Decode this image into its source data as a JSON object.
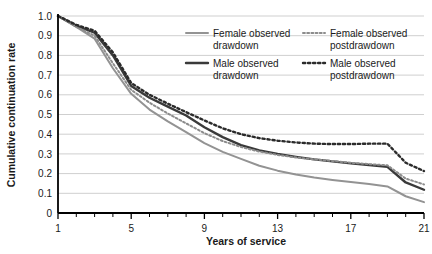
{
  "chart_data": {
    "type": "line",
    "title": "",
    "xlabel": "Years of service",
    "ylabel": "Cumulative continuation rate",
    "xlim": [
      1,
      21
    ],
    "ylim": [
      0,
      1.0
    ],
    "grid": true,
    "grid_axis": "y",
    "legend_position": "upper-right-inside",
    "x": [
      1,
      2,
      3,
      4,
      5,
      6,
      7,
      8,
      9,
      10,
      11,
      12,
      13,
      14,
      15,
      16,
      17,
      18,
      19,
      20,
      21
    ],
    "xticks": [
      1,
      5,
      9,
      13,
      17,
      21
    ],
    "xtick_labels": [
      "1",
      "5",
      "9",
      "13",
      "17",
      "21"
    ],
    "yticks": [
      0,
      0.1,
      0.2,
      0.3,
      0.4,
      0.5,
      0.6,
      0.7,
      0.8,
      0.9,
      1.0
    ],
    "ytick_labels": [
      "0",
      "0.1",
      "0.2",
      "0.3",
      "0.4",
      "0.5",
      "0.6",
      "0.7",
      "0.8",
      "0.9",
      "1.0"
    ],
    "series": [
      {
        "name": "Female observed drawdown",
        "style": "solid",
        "color": "#939393",
        "width": 2.0,
        "values": [
          1.0,
          0.945,
          0.885,
          0.735,
          0.605,
          0.525,
          0.465,
          0.41,
          0.355,
          0.31,
          0.275,
          0.24,
          0.215,
          0.195,
          0.18,
          0.168,
          0.157,
          0.147,
          0.135,
          0.085,
          0.055
        ]
      },
      {
        "name": "Male observed drawdown",
        "style": "solid",
        "color": "#3a3a3a",
        "width": 2.4,
        "values": [
          1.0,
          0.95,
          0.915,
          0.8,
          0.645,
          0.585,
          0.54,
          0.495,
          0.435,
          0.385,
          0.345,
          0.318,
          0.3,
          0.285,
          0.272,
          0.262,
          0.252,
          0.244,
          0.234,
          0.155,
          0.118
        ]
      },
      {
        "name": "Female observed postdrawdown",
        "style": "dotted",
        "color": "#8c8c8c",
        "width": 2.0,
        "values": [
          1.0,
          0.945,
          0.9,
          0.76,
          0.625,
          0.56,
          0.505,
          0.455,
          0.405,
          0.365,
          0.335,
          0.312,
          0.295,
          0.282,
          0.272,
          0.264,
          0.255,
          0.248,
          0.242,
          0.175,
          0.145
        ]
      },
      {
        "name": "Male observed postdrawdown",
        "style": "dotted",
        "color": "#2b2b2b",
        "width": 2.4,
        "values": [
          1.0,
          0.955,
          0.925,
          0.815,
          0.66,
          0.6,
          0.555,
          0.512,
          0.47,
          0.43,
          0.4,
          0.38,
          0.367,
          0.358,
          0.352,
          0.35,
          0.35,
          0.352,
          0.352,
          0.255,
          0.213
        ]
      }
    ]
  },
  "legend": {
    "entries": [
      {
        "label_line1": "Female observed",
        "label_line2": "drawdown"
      },
      {
        "label_line1": "Male observed",
        "label_line2": "drawdown"
      },
      {
        "label_line1": "Female observed",
        "label_line2": "postdrawdown"
      },
      {
        "label_line1": "Male observed",
        "label_line2": "postdrawdown"
      }
    ]
  },
  "axes": {
    "y_title": "Cumulative continuation rate",
    "x_title": "Years of service"
  },
  "colors": {
    "axis": "#000000",
    "grid": "#cfcfcf",
    "text": "#1a1a1a",
    "female_solid": "#939393",
    "male_solid": "#3a3a3a",
    "female_dotted": "#8c8c8c",
    "male_dotted": "#2b2b2b"
  }
}
